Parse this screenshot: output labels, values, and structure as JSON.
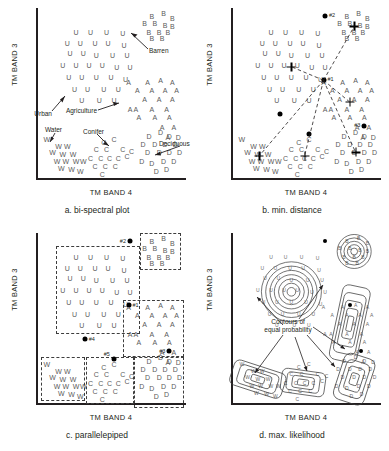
{
  "figure": {
    "axis_x_label": "TM BAND 4",
    "axis_y_label": "TM BAND 3"
  },
  "panels": [
    {
      "id": "a",
      "caption": "a. bi-spectral plot",
      "annotations": [
        {
          "text": "Urban"
        },
        {
          "text": "Barren"
        },
        {
          "text": "Agriculture"
        },
        {
          "text": "Water"
        },
        {
          "text": "Conifer"
        },
        {
          "text": "Deciduous"
        }
      ]
    },
    {
      "id": "b",
      "caption": "b. min. distance",
      "markers": [
        {
          "text": "#1"
        },
        {
          "text": "#2"
        },
        {
          "text": "#3"
        },
        {
          "text": "#4"
        },
        {
          "text": "#5"
        }
      ]
    },
    {
      "id": "c",
      "caption": "c. parallelepiped",
      "markers": [
        {
          "text": "#1"
        },
        {
          "text": "#2"
        },
        {
          "text": "#3"
        },
        {
          "text": "#4"
        },
        {
          "text": "#5"
        }
      ]
    },
    {
      "id": "d",
      "caption": "d. max. likelihood",
      "annotations": [
        {
          "text": "Contours of"
        },
        {
          "text": "equal probability"
        }
      ]
    }
  ],
  "chart_data": {
    "type": "scatter",
    "title": "",
    "xlabel": "TM BAND 4",
    "ylabel": "TM BAND 3",
    "grid": false,
    "legend": "inline-annotations",
    "xlim": [
      0,
      100
    ],
    "ylim": [
      0,
      100
    ],
    "class_glyphs": {
      "U": "Urban",
      "B": "Barren",
      "A": "Agriculture",
      "W": "Water",
      "C": "Conifer",
      "D": "Deciduous"
    },
    "series": [
      {
        "name": "Urban",
        "glyph": "U",
        "points": [
          [
            26,
            86
          ],
          [
            36,
            86
          ],
          [
            47,
            86
          ],
          [
            58,
            85
          ],
          [
            20,
            79
          ],
          [
            29,
            79
          ],
          [
            39,
            79
          ],
          [
            48,
            79
          ],
          [
            59,
            78
          ],
          [
            22,
            73
          ],
          [
            31,
            73
          ],
          [
            40,
            72
          ],
          [
            51,
            72
          ],
          [
            61,
            72
          ],
          [
            17,
            66
          ],
          [
            26,
            66
          ],
          [
            35,
            66
          ],
          [
            44,
            66
          ],
          [
            54,
            65
          ],
          [
            63,
            65
          ],
          [
            21,
            59
          ],
          [
            30,
            59
          ],
          [
            40,
            59
          ],
          [
            50,
            59
          ],
          [
            60,
            58
          ],
          [
            25,
            52
          ],
          [
            34,
            52
          ],
          [
            45,
            52
          ],
          [
            55,
            52
          ],
          [
            30,
            45
          ],
          [
            42,
            45
          ],
          [
            52,
            45
          ]
        ]
      },
      {
        "name": "Barren",
        "glyph": "B",
        "points": [
          [
            78,
            95
          ],
          [
            86,
            97
          ],
          [
            92,
            94
          ],
          [
            73,
            91
          ],
          [
            80,
            91
          ],
          [
            87,
            90
          ],
          [
            92,
            89
          ],
          [
            76,
            86
          ],
          [
            83,
            86
          ],
          [
            89,
            86
          ],
          [
            78,
            82
          ],
          [
            85,
            82
          ]
        ]
      },
      {
        "name": "Agriculture",
        "glyph": "A",
        "points": [
          [
            62,
            56
          ],
          [
            75,
            56
          ],
          [
            84,
            57
          ],
          [
            92,
            56
          ],
          [
            68,
            51
          ],
          [
            78,
            51
          ],
          [
            87,
            51
          ],
          [
            95,
            51
          ],
          [
            73,
            46
          ],
          [
            83,
            46
          ],
          [
            92,
            46
          ],
          [
            63,
            40
          ],
          [
            67,
            40
          ],
          [
            78,
            40
          ],
          [
            88,
            40
          ],
          [
            69,
            35
          ],
          [
            80,
            35
          ],
          [
            90,
            35
          ],
          [
            85,
            29
          ],
          [
            93,
            29
          ],
          [
            89,
            23
          ]
        ]
      },
      {
        "name": "Water",
        "glyph": "W",
        "points": [
          [
            6,
            22
          ],
          [
            14,
            18
          ],
          [
            20,
            18
          ],
          [
            10,
            14
          ],
          [
            17,
            13
          ],
          [
            24,
            13
          ],
          [
            13,
            9
          ],
          [
            19,
            9
          ],
          [
            26,
            9
          ],
          [
            31,
            9
          ],
          [
            16,
            5
          ],
          [
            23,
            4
          ],
          [
            29,
            3
          ]
        ]
      },
      {
        "name": "Conifer",
        "glyph": "C",
        "points": [
          [
            45,
            20
          ],
          [
            52,
            22
          ],
          [
            40,
            16
          ],
          [
            47,
            16
          ],
          [
            58,
            16
          ],
          [
            64,
            15
          ],
          [
            36,
            11
          ],
          [
            43,
            11
          ],
          [
            49,
            11
          ],
          [
            55,
            11
          ],
          [
            61,
            12
          ],
          [
            39,
            6
          ],
          [
            46,
            6
          ],
          [
            53,
            6
          ],
          [
            44,
            1
          ]
        ]
      },
      {
        "name": "Deciduous",
        "glyph": "D",
        "points": [
          [
            76,
            24
          ],
          [
            84,
            26
          ],
          [
            90,
            24
          ],
          [
            96,
            23
          ],
          [
            72,
            19
          ],
          [
            80,
            19
          ],
          [
            87,
            19
          ],
          [
            94,
            19
          ],
          [
            75,
            14
          ],
          [
            83,
            14
          ],
          [
            90,
            14
          ],
          [
            97,
            14
          ],
          [
            71,
            9
          ],
          [
            78,
            8
          ],
          [
            86,
            9
          ],
          [
            93,
            9
          ],
          [
            81,
            3
          ],
          [
            88,
            4
          ]
        ]
      }
    ],
    "cluster_centroids": [
      {
        "label": "#1",
        "class": "Agriculture",
        "x": 62,
        "y": 57
      },
      {
        "label": "#2",
        "class": "Urban/Barren",
        "x": 63,
        "y": 95
      },
      {
        "label": "#3",
        "class": "Agriculture",
        "x": 90,
        "y": 30
      },
      {
        "label": "#4",
        "class": "Urban",
        "x": 32,
        "y": 37
      },
      {
        "label": "#5",
        "class": "Conifer",
        "x": 52,
        "y": 25
      }
    ]
  }
}
